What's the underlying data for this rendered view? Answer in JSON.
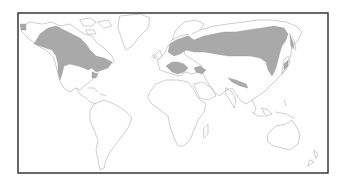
{
  "map": {
    "type": "world-distribution-map",
    "projection": "equirectangular-like",
    "frame": {
      "x": 18,
      "y": 13,
      "width": 310,
      "height": 160,
      "color": "#2a2a2a"
    },
    "colors": {
      "background": "#ffffff",
      "coastline": "#b9b9b9",
      "range_fill": "#a9a9a9"
    },
    "shaded_regions": [
      {
        "id": "north-america",
        "label": "Alaska, Canada and northern United States"
      },
      {
        "id": "northern-eurasia",
        "label": "Scandinavia through Siberia to the Pacific coast"
      },
      {
        "id": "southern-europe",
        "label": "Central and southern Europe, Balkans"
      },
      {
        "id": "caucasus-anatolia",
        "label": "Caucasus / Anatolia region"
      },
      {
        "id": "central-asia-streak",
        "label": "Central Asian mountain belt"
      },
      {
        "id": "japan",
        "label": "Japan"
      },
      {
        "id": "kamchatka",
        "label": "Kamchatka"
      }
    ],
    "labels": []
  }
}
